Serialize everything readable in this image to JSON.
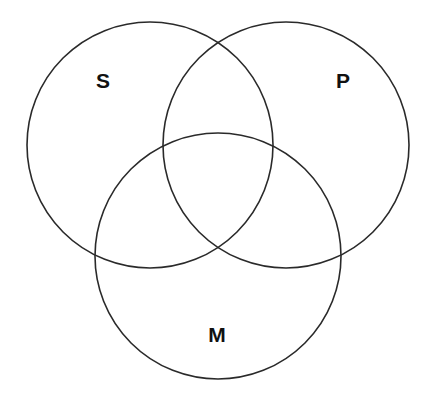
{
  "diagram": {
    "type": "venn",
    "stroke_color": "#2a2a2a",
    "background": "#ffffff",
    "sets": [
      {
        "id": "S",
        "label": "S",
        "cx": 150,
        "cy": 145,
        "r": 123,
        "label_x": 103,
        "label_y": 82
      },
      {
        "id": "P",
        "label": "P",
        "cx": 286,
        "cy": 145,
        "r": 123,
        "label_x": 343,
        "label_y": 82
      },
      {
        "id": "M",
        "label": "M",
        "cx": 218,
        "cy": 256,
        "r": 123,
        "label_x": 217,
        "label_y": 336
      }
    ]
  }
}
